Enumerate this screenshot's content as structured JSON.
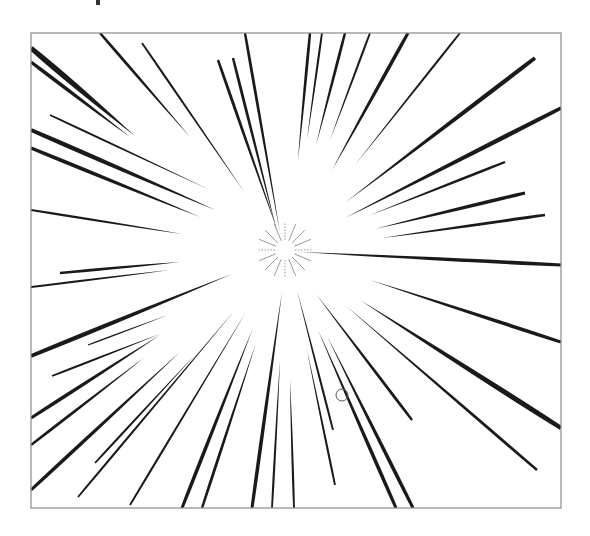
{
  "illustration": {
    "title": "Radial speed lines",
    "frame": {
      "x": 31,
      "y": 33,
      "width": 530,
      "height": 475,
      "stroke": "#8a8a8a"
    },
    "ink_color": "#1a1a1a",
    "center": {
      "x": 285,
      "y": 250
    },
    "sparkle": {
      "rays": 16,
      "inner": 10,
      "outer": 28,
      "color": "#9a9a9a"
    },
    "cursor_mark": {
      "x": 342,
      "y": 395,
      "r": 6
    },
    "rays": [
      {
        "x1": 31,
        "y1": 48,
        "x2": 135,
        "y2": 136,
        "w": 8
      },
      {
        "x1": 31,
        "y1": 62,
        "x2": 130,
        "y2": 137,
        "w": 5
      },
      {
        "x1": 100,
        "y1": 33,
        "x2": 190,
        "y2": 137,
        "w": 4
      },
      {
        "x1": 142,
        "y1": 43,
        "x2": 245,
        "y2": 193,
        "w": 3
      },
      {
        "x1": 50,
        "y1": 115,
        "x2": 210,
        "y2": 190,
        "w": 3
      },
      {
        "x1": 31,
        "y1": 130,
        "x2": 215,
        "y2": 210,
        "w": 6
      },
      {
        "x1": 31,
        "y1": 148,
        "x2": 200,
        "y2": 217,
        "w": 5
      },
      {
        "x1": 31,
        "y1": 210,
        "x2": 182,
        "y2": 234,
        "w": 3
      },
      {
        "x1": 218,
        "y1": 60,
        "x2": 278,
        "y2": 232,
        "w": 4
      },
      {
        "x1": 233,
        "y1": 58,
        "x2": 276,
        "y2": 228,
        "w": 4
      },
      {
        "x1": 245,
        "y1": 33,
        "x2": 280,
        "y2": 233,
        "w": 4
      },
      {
        "x1": 310,
        "y1": 33,
        "x2": 298,
        "y2": 160,
        "w": 4
      },
      {
        "x1": 322,
        "y1": 33,
        "x2": 307,
        "y2": 140,
        "w": 3
      },
      {
        "x1": 345,
        "y1": 33,
        "x2": 316,
        "y2": 145,
        "w": 4
      },
      {
        "x1": 370,
        "y1": 33,
        "x2": 330,
        "y2": 140,
        "w": 3
      },
      {
        "x1": 408,
        "y1": 33,
        "x2": 332,
        "y2": 170,
        "w": 5
      },
      {
        "x1": 460,
        "y1": 33,
        "x2": 355,
        "y2": 165,
        "w": 3
      },
      {
        "x1": 535,
        "y1": 58,
        "x2": 346,
        "y2": 202,
        "w": 6
      },
      {
        "x1": 561,
        "y1": 108,
        "x2": 345,
        "y2": 218,
        "w": 6
      },
      {
        "x1": 505,
        "y1": 162,
        "x2": 368,
        "y2": 216,
        "w": 4
      },
      {
        "x1": 525,
        "y1": 193,
        "x2": 375,
        "y2": 229,
        "w": 5
      },
      {
        "x1": 545,
        "y1": 215,
        "x2": 382,
        "y2": 238,
        "w": 4
      },
      {
        "x1": 561,
        "y1": 265,
        "x2": 300,
        "y2": 252,
        "w": 5
      },
      {
        "x1": 60,
        "y1": 273,
        "x2": 180,
        "y2": 262,
        "w": 4
      },
      {
        "x1": 31,
        "y1": 287,
        "x2": 170,
        "y2": 270,
        "w": 3
      },
      {
        "x1": 31,
        "y1": 356,
        "x2": 232,
        "y2": 274,
        "w": 6
      },
      {
        "x1": 88,
        "y1": 345,
        "x2": 168,
        "y2": 315,
        "w": 2
      },
      {
        "x1": 52,
        "y1": 376,
        "x2": 160,
        "y2": 334,
        "w": 3
      },
      {
        "x1": 31,
        "y1": 418,
        "x2": 160,
        "y2": 335,
        "w": 5
      },
      {
        "x1": 31,
        "y1": 445,
        "x2": 145,
        "y2": 357,
        "w": 4
      },
      {
        "x1": 31,
        "y1": 490,
        "x2": 180,
        "y2": 352,
        "w": 5
      },
      {
        "x1": 95,
        "y1": 463,
        "x2": 195,
        "y2": 355,
        "w": 3
      },
      {
        "x1": 78,
        "y1": 497,
        "x2": 235,
        "y2": 310,
        "w": 3
      },
      {
        "x1": 130,
        "y1": 505,
        "x2": 246,
        "y2": 312,
        "w": 3
      },
      {
        "x1": 182,
        "y1": 508,
        "x2": 253,
        "y2": 328,
        "w": 5
      },
      {
        "x1": 202,
        "y1": 508,
        "x2": 256,
        "y2": 343,
        "w": 4
      },
      {
        "x1": 252,
        "y1": 508,
        "x2": 282,
        "y2": 292,
        "w": 5
      },
      {
        "x1": 272,
        "y1": 508,
        "x2": 280,
        "y2": 360,
        "w": 3
      },
      {
        "x1": 294,
        "y1": 508,
        "x2": 290,
        "y2": 380,
        "w": 3
      },
      {
        "x1": 396,
        "y1": 508,
        "x2": 318,
        "y2": 330,
        "w": 5
      },
      {
        "x1": 413,
        "y1": 508,
        "x2": 327,
        "y2": 336,
        "w": 5
      },
      {
        "x1": 335,
        "y1": 485,
        "x2": 307,
        "y2": 350,
        "w": 3
      },
      {
        "x1": 333,
        "y1": 430,
        "x2": 297,
        "y2": 290,
        "w": 3
      },
      {
        "x1": 412,
        "y1": 420,
        "x2": 316,
        "y2": 294,
        "w": 4
      },
      {
        "x1": 537,
        "y1": 470,
        "x2": 345,
        "y2": 305,
        "w": 4
      },
      {
        "x1": 561,
        "y1": 428,
        "x2": 360,
        "y2": 300,
        "w": 7
      },
      {
        "x1": 561,
        "y1": 342,
        "x2": 370,
        "y2": 280,
        "w": 5
      }
    ]
  }
}
